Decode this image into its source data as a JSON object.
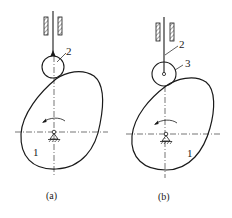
{
  "figure": {
    "stroke_color": "#1a1a1a",
    "background": "#ffffff"
  },
  "panels": [
    {
      "id": "a",
      "caption": "(a)",
      "follower_type": "pointed follower with roller",
      "labels": {
        "cam": "1",
        "follower": "2"
      }
    },
    {
      "id": "b",
      "caption": "(b)",
      "follower_type": "roller follower",
      "labels": {
        "cam": "1",
        "follower": "2",
        "roller": "3"
      }
    }
  ]
}
